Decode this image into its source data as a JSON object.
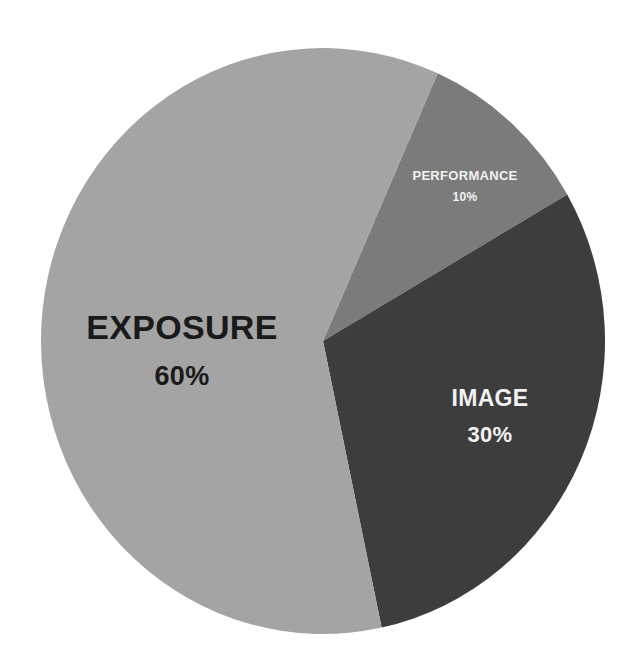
{
  "chart_data": {
    "type": "pie",
    "title": "",
    "categories": [
      "EXPOSURE",
      "PERFORMANCE",
      "IMAGE"
    ],
    "values": [
      60,
      10,
      30
    ],
    "unit": "%",
    "labels": [
      {
        "name": "EXPOSURE",
        "percent": "60%",
        "color": "#a4a4a4",
        "text_color": "#1a1a1a"
      },
      {
        "name": "PERFORMANCE",
        "percent": "10%",
        "color": "#7b7b7b",
        "text_color": "#f2f2f2"
      },
      {
        "name": "IMAGE",
        "percent": "30%",
        "color": "#3d3d3d",
        "text_color": "#f2f2f2"
      }
    ],
    "legend": "none",
    "start_angle_deg_clockwise_from_top": 24
  },
  "slices": {
    "exposure": {
      "name": "EXPOSURE",
      "percent": "60%"
    },
    "performance": {
      "name": "PERFORMANCE",
      "percent": "10%"
    },
    "image": {
      "name": "IMAGE",
      "percent": "30%"
    }
  }
}
